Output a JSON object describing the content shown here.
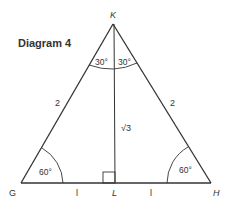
{
  "title": "Diagram 4",
  "vertices": {
    "K": {
      "label": "K"
    },
    "G": {
      "label": "G"
    },
    "H": {
      "label": "H"
    },
    "L": {
      "label": "L"
    }
  },
  "angles": {
    "K_left": "30°",
    "K_right": "30°",
    "G": "60°",
    "H": "60°"
  },
  "sides": {
    "GK": "2",
    "KH": "2",
    "KL": "√3",
    "GL": "l",
    "LH": "l"
  },
  "colors": {
    "line": "#333333",
    "background": "#ffffff"
  }
}
